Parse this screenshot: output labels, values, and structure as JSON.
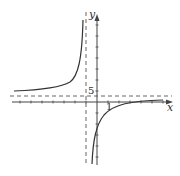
{
  "figure": {
    "type": "function graph with asymptotes",
    "axes": {
      "x_label": "x",
      "y_label": "y"
    },
    "annotations": {
      "horizontal_asymptote_label": "5",
      "x_tick_label": "1"
    },
    "asymptotes": {
      "vertical_x": -1,
      "horizontal_y": 5
    },
    "colors": {
      "curve": "#333333",
      "axis": "#444444",
      "dashed": "#555555"
    }
  }
}
